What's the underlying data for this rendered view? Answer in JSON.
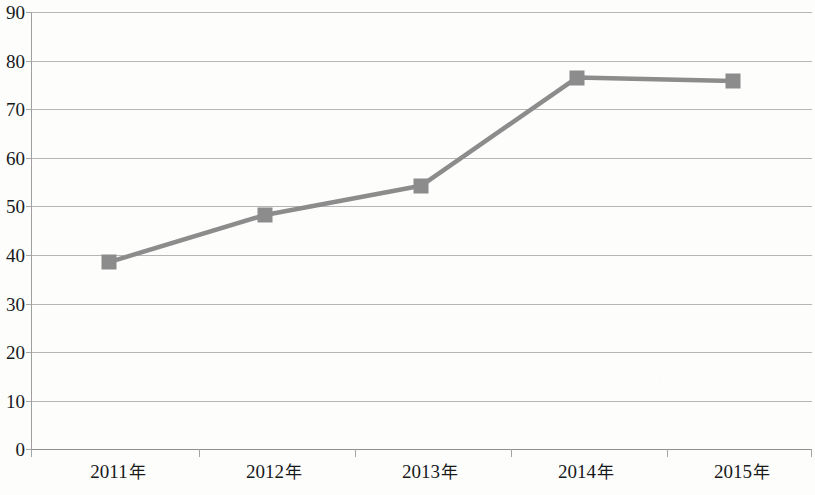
{
  "chart_data": {
    "type": "line",
    "title": "",
    "subtitle": "",
    "xlabel": "",
    "ylabel": "",
    "categories": [
      "2011年",
      "2012年",
      "2013年",
      "2014年",
      "2015年"
    ],
    "values": [
      38.5,
      48.2,
      54.2,
      76.5,
      75.8
    ],
    "series": [
      {
        "name": "",
        "values": [
          38.5,
          48.2,
          54.2,
          76.5,
          75.8
        ]
      }
    ],
    "ylim": [
      0,
      90
    ],
    "y_ticks": [
      0,
      10,
      20,
      30,
      40,
      50,
      60,
      70,
      80,
      90
    ],
    "y_tick_labels": [
      "0",
      "10",
      "20",
      "30",
      "40",
      "50",
      "60",
      "70",
      "80",
      "90"
    ],
    "grid": true,
    "grid_axis": "y",
    "legend": false,
    "legend_position": "none",
    "marker": "square",
    "marker_color": "#8c8c8c",
    "line_color": "#8c8c8c",
    "gridline_color": "#a9a9a9",
    "axis_color": "#8f8f8f",
    "background_color": "#fdfdfc",
    "text_color": "#17191a",
    "annotations": []
  },
  "axis": {
    "y_ticks": [
      {
        "label": "90",
        "value": 90
      },
      {
        "label": "80",
        "value": 80
      },
      {
        "label": "70",
        "value": 70
      },
      {
        "label": "60",
        "value": 60
      },
      {
        "label": "50",
        "value": 50
      },
      {
        "label": "40",
        "value": 40
      },
      {
        "label": "30",
        "value": 30
      },
      {
        "label": "20",
        "value": 20
      },
      {
        "label": "10",
        "value": 10
      },
      {
        "label": "0",
        "value": 0
      }
    ],
    "x_ticks": [
      {
        "year": "2011",
        "suffix": "年"
      },
      {
        "year": "2012",
        "suffix": "年"
      },
      {
        "year": "2013",
        "suffix": "年"
      },
      {
        "year": "2014",
        "suffix": "年"
      },
      {
        "year": "2015",
        "suffix": "年"
      }
    ]
  }
}
